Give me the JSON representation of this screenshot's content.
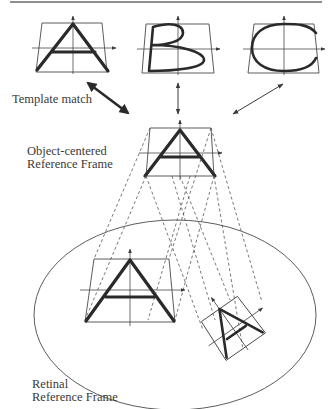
{
  "figure": {
    "labels": {
      "template_match": "Template match",
      "object_frame_line1": "Object-centered",
      "object_frame_line2": "Reference Frame",
      "retinal_frame_line1": "Retinal",
      "retinal_frame_line2": "Reference Frame"
    },
    "templates": [
      {
        "letter": "A",
        "name": "template-a"
      },
      {
        "letter": "B",
        "name": "template-b"
      },
      {
        "letter": "C",
        "name": "template-c"
      }
    ],
    "colors": {
      "ink": "#2a2a2a",
      "thin_line": "#4a4a4a",
      "rule": "#6a6a6a",
      "background": "#ffffff"
    }
  }
}
